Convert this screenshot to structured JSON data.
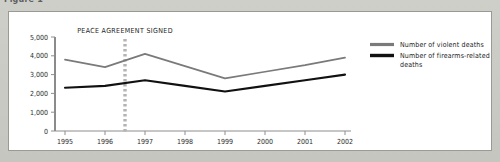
{
  "figure": {
    "top_caption": "Figure 1",
    "annotation": "PEACE AGREEMENT SIGNED"
  },
  "legend": {
    "items": [
      {
        "label": "Number of violent deaths",
        "color": "#7a7a7a",
        "swatch_name": "legend-swatch-violent"
      },
      {
        "label": "Number of firearms-related deaths",
        "color": "#111111",
        "swatch_name": "legend-swatch-firearms"
      }
    ]
  },
  "axes": {
    "y_ticks": [
      "0",
      "1,000",
      "2,000",
      "3,000",
      "4,000",
      "5,000"
    ],
    "x_ticks": [
      "1995",
      "1996",
      "1997",
      "1998",
      "1999",
      "2000",
      "2001",
      "2002"
    ]
  },
  "chart_data": {
    "type": "line",
    "title": "",
    "subtitle": "",
    "xlabel": "",
    "ylabel": "",
    "categories": [
      "1995",
      "1996",
      "1997",
      "1998",
      "1999",
      "2000",
      "2001",
      "2002"
    ],
    "x": [
      1995,
      1996,
      1997,
      1998,
      1999,
      2000,
      2001,
      2002
    ],
    "series": [
      {
        "name": "Number of violent deaths",
        "color": "#7a7a7a",
        "values": [
          3800,
          3400,
          4100,
          3450,
          2800,
          3150,
          3500,
          3900
        ]
      },
      {
        "name": "Number of firearms-related deaths",
        "color": "#111111",
        "values": [
          2300,
          2400,
          2700,
          2400,
          2100,
          2400,
          2700,
          3000
        ]
      }
    ],
    "ylim": [
      0,
      5000
    ],
    "ytick_values": [
      0,
      1000,
      2000,
      3000,
      4000,
      5000
    ],
    "grid": false,
    "legend_position": "right",
    "annotations": [
      {
        "text": "PEACE AGREEMENT SIGNED",
        "x": 1996.5,
        "style": "dashed-vertical-line",
        "color": "#b4b4b4"
      }
    ]
  }
}
